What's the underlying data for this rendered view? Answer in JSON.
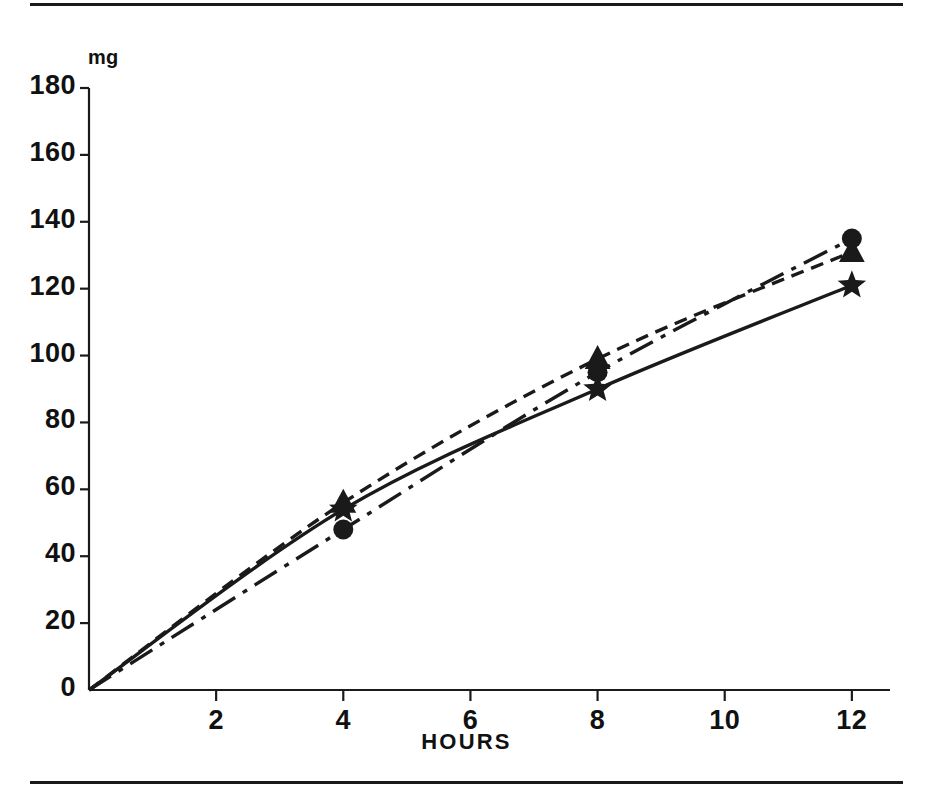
{
  "figure": {
    "unit_label": "mg",
    "x_axis_title": "HOURS",
    "ink_color": "#1a1a1a",
    "background_color": "#ffffff"
  },
  "chart_data": {
    "type": "line",
    "title": "",
    "subtitle": "",
    "xlabel": "HOURS",
    "ylabel": "mg",
    "xlim": [
      0,
      12.6
    ],
    "ylim": [
      0,
      180
    ],
    "grid": false,
    "legend": "none",
    "x_ticks": [
      2,
      4,
      6,
      8,
      10,
      12
    ],
    "x_tick_labels": [
      "2",
      "4",
      "6",
      "8",
      "10",
      "12"
    ],
    "y_ticks": [
      0,
      20,
      40,
      60,
      80,
      100,
      120,
      140,
      160,
      180
    ],
    "y_tick_labels": [
      "0",
      "20",
      "40",
      "60",
      "80",
      "100",
      "120",
      "140",
      "160",
      "180"
    ],
    "series": [
      {
        "name": "circle-series",
        "marker": "circle",
        "linestyle": "dash-dot",
        "color": "#1a1a1a",
        "x": [
          0,
          4,
          8,
          12
        ],
        "values": [
          0,
          48,
          95,
          135
        ]
      },
      {
        "name": "triangle-series",
        "marker": "triangle",
        "linestyle": "dashed",
        "color": "#1a1a1a",
        "x": [
          0,
          4,
          8,
          12
        ],
        "values": [
          0,
          56,
          99,
          131
        ]
      },
      {
        "name": "star-series",
        "marker": "star",
        "linestyle": "solid",
        "color": "#1a1a1a",
        "x": [
          0,
          4,
          8,
          12
        ],
        "values": [
          0,
          54,
          90,
          121
        ]
      }
    ]
  }
}
